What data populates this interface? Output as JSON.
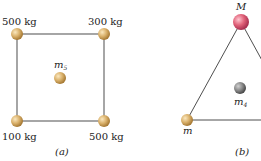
{
  "figure_a": {
    "caption": "(a)",
    "masses": {
      "top_left": "500 kg",
      "top_right": "300 kg",
      "bottom_left": "100 kg",
      "bottom_right": "500 kg"
    },
    "center_label": "m",
    "center_subscript": "5"
  },
  "figure_b": {
    "caption": "(b)",
    "top_label": "M",
    "bottom_left_label": "m",
    "inner_label": "m",
    "inner_subscript": "4"
  },
  "colors": {
    "gold_ball": "#d9b06a",
    "gold_dark": "#a77a35",
    "red_ball": "#e06078",
    "red_dark": "#a83050",
    "gray_ball": "#8a8a8a",
    "gray_dark": "#4a4a4a",
    "line": "#3a3a3a"
  }
}
